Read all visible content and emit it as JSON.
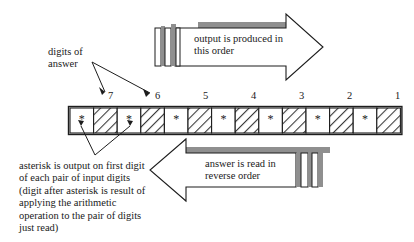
{
  "diagram": {
    "labels": {
      "digits_of_answer": "digits of\nanswer",
      "output_order": "output is produced in\nthis order",
      "reverse_order": "answer is read in\nreverse order",
      "asterisk_note": "asterisk is output on first digit\nof each pair of input digits\n(digit after asterisk is result of\napplying the arithmetic\noperation to the pair of digits\njust read)"
    },
    "tape": {
      "cell_count": 14,
      "pattern": [
        "asterisk",
        "hatched",
        "asterisk",
        "hatched",
        "asterisk",
        "hatched",
        "asterisk",
        "hatched",
        "asterisk",
        "hatched",
        "asterisk",
        "hatched",
        "asterisk",
        "hatched"
      ],
      "asterisk_glyph": "*",
      "numbers": [
        "7",
        "6",
        "5",
        "4",
        "3",
        "2",
        "1"
      ],
      "number_positions": [
        108,
        155,
        203,
        251,
        299,
        347,
        395
      ]
    },
    "colors": {
      "ink": "#1a1a1a",
      "shadow": "#8c8c8c",
      "hatch": "#444444",
      "paper": "#ffffff"
    }
  }
}
